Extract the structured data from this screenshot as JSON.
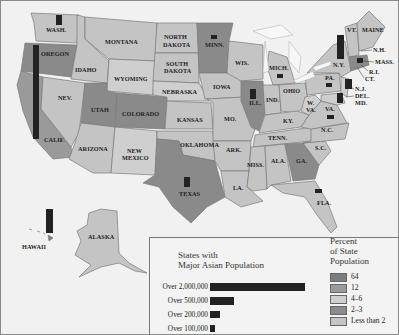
{
  "map": {
    "type": "choropleth",
    "subject": "States with Major Asian Population",
    "colors": {
      "background": "#f1f1f1",
      "water": "#f4f4f4",
      "lake": "#f7f7f7",
      "border": "#7a7a7a",
      "pop_bar": "#222222",
      "shade_64": "#7d7d7d",
      "shade_12": "#9a9a9a",
      "shade_4_6": "#cfcfcf",
      "shade_2_3": "#8a8a8a",
      "shade_less_2": "#c4c4c4"
    },
    "state_labels": [
      {
        "id": "wash",
        "text": "WASH."
      },
      {
        "id": "oregon",
        "text": "OREGON"
      },
      {
        "id": "calif",
        "text": "CALIF."
      },
      {
        "id": "idaho",
        "text": "IDAHO"
      },
      {
        "id": "nev",
        "text": "NEV."
      },
      {
        "id": "montana",
        "text": "MONTANA"
      },
      {
        "id": "wyoming",
        "text": "WYOMING"
      },
      {
        "id": "utah",
        "text": "UTAH"
      },
      {
        "id": "colorado",
        "text": "COLORADO"
      },
      {
        "id": "arizona",
        "text": "ARIZONA"
      },
      {
        "id": "new_mexico_1",
        "text": "NEW"
      },
      {
        "id": "new_mexico_2",
        "text": "MEXICO"
      },
      {
        "id": "north_dakota_1",
        "text": "NORTH"
      },
      {
        "id": "north_dakota_2",
        "text": "DAKOTA"
      },
      {
        "id": "south_dakota_1",
        "text": "SOUTH"
      },
      {
        "id": "south_dakota_2",
        "text": "DAKOTA"
      },
      {
        "id": "nebraska",
        "text": "NEBRASKA"
      },
      {
        "id": "kansas",
        "text": "KANSAS"
      },
      {
        "id": "oklahoma",
        "text": "OKLAHOMA"
      },
      {
        "id": "texas",
        "text": "TEXAS"
      },
      {
        "id": "minn",
        "text": "MINN."
      },
      {
        "id": "iowa",
        "text": "IOWA"
      },
      {
        "id": "mo",
        "text": "MO."
      },
      {
        "id": "ark",
        "text": "ARK."
      },
      {
        "id": "la",
        "text": "LA."
      },
      {
        "id": "wis",
        "text": "WIS."
      },
      {
        "id": "ill",
        "text": "ILL."
      },
      {
        "id": "mich",
        "text": "MICH."
      },
      {
        "id": "ind",
        "text": "IND."
      },
      {
        "id": "ohio",
        "text": "OHIO"
      },
      {
        "id": "ky",
        "text": "KY."
      },
      {
        "id": "tenn",
        "text": "TENN."
      },
      {
        "id": "miss",
        "text": "MISS."
      },
      {
        "id": "ala",
        "text": "ALA."
      },
      {
        "id": "ga",
        "text": "GA."
      },
      {
        "id": "fla",
        "text": "FLA."
      },
      {
        "id": "sc",
        "text": "S.C."
      },
      {
        "id": "nc",
        "text": "N.C."
      },
      {
        "id": "va",
        "text": "VA."
      },
      {
        "id": "wva_1",
        "text": "W."
      },
      {
        "id": "wva_2",
        "text": "VA."
      },
      {
        "id": "pa",
        "text": "PA."
      },
      {
        "id": "ny",
        "text": "N.Y."
      },
      {
        "id": "vt",
        "text": "VT."
      },
      {
        "id": "maine",
        "text": "MAINE"
      },
      {
        "id": "nh",
        "text": "N.H."
      },
      {
        "id": "mass",
        "text": "MASS."
      },
      {
        "id": "ri",
        "text": "R.I."
      },
      {
        "id": "ct",
        "text": "CT."
      },
      {
        "id": "nj",
        "text": "N.J."
      },
      {
        "id": "del",
        "text": "DEL."
      },
      {
        "id": "md",
        "text": "MD."
      },
      {
        "id": "alaska",
        "text": "ALASKA"
      },
      {
        "id": "hawaii",
        "text": "HAWAII"
      }
    ],
    "population_markers": [
      {
        "state": "California",
        "category": "Over 2,000,000"
      },
      {
        "state": "New York",
        "category": "Over 500,000"
      },
      {
        "state": "Hawaii",
        "category": "Over 500,000"
      },
      {
        "state": "Texas",
        "category": "Over 200,000"
      },
      {
        "state": "Illinois",
        "category": "Over 200,000"
      },
      {
        "state": "New Jersey",
        "category": "Over 200,000"
      },
      {
        "state": "Maryland",
        "category": "Over 200,000"
      },
      {
        "state": "Washington",
        "category": "Over 200,000"
      },
      {
        "state": "Massachusetts",
        "category": "Over 100,000"
      },
      {
        "state": "Pennsylvania",
        "category": "Over 100,000"
      },
      {
        "state": "Virginia",
        "category": "Over 100,000"
      },
      {
        "state": "Michigan",
        "category": "Over 100,000"
      },
      {
        "state": "Minnesota",
        "category": "Over 100,000"
      },
      {
        "state": "Florida",
        "category": "Over 100,000"
      }
    ]
  },
  "legend": {
    "title_line1": "States with",
    "title_line2": "Major Asian Population",
    "population_rows": [
      {
        "label": "Over 2,000,000",
        "bar_width": 95
      },
      {
        "label": "Over 500,000",
        "bar_width": 24
      },
      {
        "label": "Over 200,000",
        "bar_width": 10
      },
      {
        "label": "Over 100,000",
        "bar_width": 5
      }
    ],
    "percent_title_line1": "Percent",
    "percent_title_line2": "of State",
    "percent_title_line3": "Population",
    "percent_rows": [
      {
        "label": "64",
        "color": "#7d7d7d"
      },
      {
        "label": "12",
        "color": "#9a9a9a"
      },
      {
        "label": "4–6",
        "color": "#cfcfcf"
      },
      {
        "label": "2–3",
        "color": "#8a8a8a"
      },
      {
        "label": "Less than 2",
        "color": "#c4c4c4"
      }
    ]
  }
}
